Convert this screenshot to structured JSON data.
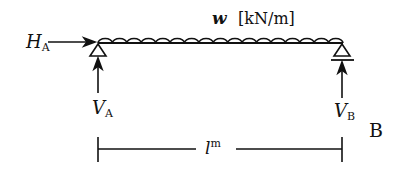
{
  "diagram": {
    "type": "simply-supported-beam",
    "load": {
      "symbol": "w",
      "unit": "[kN/m]",
      "kind": "uniformly-distributed",
      "arc_count": 17
    },
    "horizontal_reaction": {
      "symbol": "H",
      "subscript": "A"
    },
    "left_reaction": {
      "symbol": "V",
      "subscript": "A"
    },
    "right_reaction": {
      "symbol": "V",
      "subscript": "B"
    },
    "right_label": "B",
    "span": {
      "symbol": "l",
      "superscript": "m"
    },
    "colors": {
      "stroke": "#111111",
      "background": "#ffffff"
    }
  }
}
